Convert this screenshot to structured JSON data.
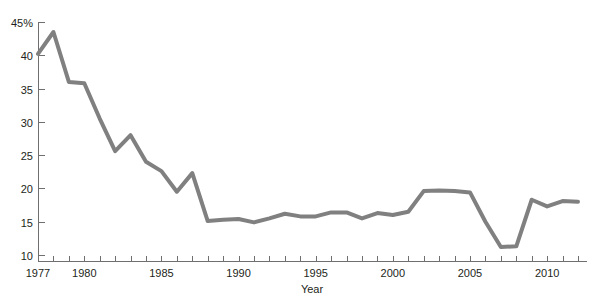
{
  "chart_data": {
    "type": "line",
    "title": "",
    "subtitle": "",
    "xlabel": "Year",
    "ylabel": "",
    "xlim": [
      1976.6,
      2012.4
    ],
    "ylim": [
      9.0,
      45.8
    ],
    "grid": false,
    "legend": null,
    "y_tick_labels": [
      "45%",
      "40",
      "35",
      "30",
      "25",
      "20",
      "15",
      "10"
    ],
    "y_ticks": [
      45,
      40,
      35,
      30,
      25,
      20,
      15,
      10
    ],
    "x_tick_labels": [
      "1977",
      "1980",
      "1985",
      "1990",
      "1995",
      "2000",
      "2005",
      "2010"
    ],
    "x_major_ticks": [
      1977,
      1980,
      1985,
      1990,
      1995,
      2000,
      2005,
      2010
    ],
    "x_minor_tick_interval": 1,
    "series": [
      {
        "name": "series-1",
        "color": "#808080",
        "line_width": 4,
        "x": [
          1977,
          1978,
          1979,
          1980,
          1981,
          1982,
          1983,
          1984,
          1985,
          1986,
          1987,
          1988,
          1989,
          1990,
          1991,
          1992,
          1993,
          1994,
          1995,
          1996,
          1997,
          1998,
          1999,
          2000,
          2001,
          2002,
          2003,
          2004,
          2005,
          2006,
          2007,
          2008,
          2009,
          2010,
          2011,
          2012
        ],
        "values": [
          40.2,
          43.5,
          36.0,
          35.8,
          30.5,
          25.6,
          28.0,
          24.0,
          22.6,
          19.5,
          22.3,
          15.1,
          15.3,
          15.4,
          14.9,
          15.5,
          16.2,
          15.8,
          15.8,
          16.4,
          16.4,
          15.5,
          16.3,
          16.0,
          16.5,
          19.6,
          19.7,
          19.6,
          19.4,
          15.0,
          11.2,
          11.3,
          18.3,
          17.3,
          18.1,
          18.0
        ]
      }
    ]
  },
  "axis": {
    "x_title": "Year",
    "y_unit_label": "45%"
  }
}
